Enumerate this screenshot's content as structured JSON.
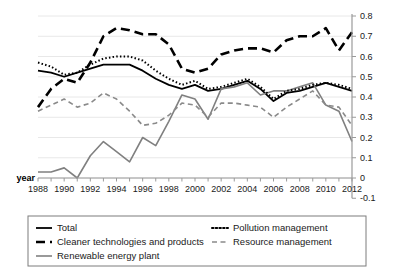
{
  "chart_data": {
    "type": "line",
    "title": "",
    "xlabel": "year",
    "ylabel": "",
    "grid": true,
    "legend_position": "bottom",
    "ylim": [
      -0.1,
      0.8
    ],
    "y_axis_side": "right",
    "yticks": [
      "0.8",
      "0.7",
      "0.6",
      "0.5",
      "0.4",
      "0.3",
      "0.2",
      "0.1",
      "0",
      "-0.1"
    ],
    "ytick_values": [
      0.8,
      0.7,
      0.6,
      0.5,
      0.4,
      0.3,
      0.2,
      0.1,
      0,
      -0.1
    ],
    "x": [
      1988,
      1989,
      1990,
      1991,
      1992,
      1993,
      1994,
      1995,
      1996,
      1997,
      1998,
      1999,
      2000,
      2001,
      2002,
      2003,
      2004,
      2005,
      2006,
      2007,
      2008,
      2009,
      2010,
      2011,
      2012
    ],
    "xticklabels": [
      "1988",
      "1990",
      "1992",
      "1994",
      "1996",
      "1998",
      "2000",
      "2002",
      "2004",
      "2006",
      "2008",
      "2010",
      "2012"
    ],
    "xtick_values": [
      1988,
      1990,
      1992,
      1994,
      1996,
      1998,
      2000,
      2002,
      2004,
      2006,
      2008,
      2010,
      2012
    ],
    "series": [
      {
        "name": "Total",
        "style": "solid",
        "color": "#000000",
        "width": 1.8,
        "values": [
          0.53,
          0.52,
          0.5,
          0.52,
          0.54,
          0.56,
          0.56,
          0.56,
          0.53,
          0.49,
          0.46,
          0.44,
          0.46,
          0.43,
          0.44,
          0.46,
          0.48,
          0.44,
          0.38,
          0.42,
          0.43,
          0.45,
          0.47,
          0.45,
          0.43
        ]
      },
      {
        "name": "Cleaner technologies and products",
        "style": "long-dash",
        "color": "#000000",
        "width": 2.6,
        "values": [
          0.35,
          0.44,
          0.49,
          0.47,
          0.57,
          0.7,
          0.74,
          0.73,
          0.71,
          0.71,
          0.66,
          0.54,
          0.52,
          0.54,
          0.61,
          0.63,
          0.64,
          0.64,
          0.62,
          0.68,
          0.7,
          0.7,
          0.74,
          0.63,
          0.72
        ]
      },
      {
        "name": "Renewable energy plant",
        "style": "solid",
        "color": "#808080",
        "width": 1.6,
        "values": [
          0.03,
          0.03,
          0.05,
          0.0,
          0.11,
          0.18,
          0.13,
          0.08,
          0.2,
          0.16,
          0.28,
          0.41,
          0.39,
          0.29,
          0.44,
          0.45,
          0.47,
          0.41,
          0.43,
          0.43,
          0.45,
          0.47,
          0.36,
          0.33,
          0.18
        ]
      },
      {
        "name": "Pollution management",
        "style": "dotted",
        "color": "#000000",
        "width": 2.0,
        "values": [
          0.57,
          0.55,
          0.51,
          0.52,
          0.56,
          0.59,
          0.6,
          0.6,
          0.58,
          0.53,
          0.49,
          0.46,
          0.48,
          0.44,
          0.45,
          0.47,
          0.49,
          0.45,
          0.39,
          0.43,
          0.44,
          0.46,
          0.47,
          0.46,
          0.44
        ]
      },
      {
        "name": "Resource management",
        "style": "dash",
        "color": "#8a8a8a",
        "width": 1.6,
        "values": [
          0.33,
          0.36,
          0.39,
          0.35,
          0.37,
          0.42,
          0.39,
          0.33,
          0.26,
          0.27,
          0.31,
          0.37,
          0.36,
          0.3,
          0.37,
          0.37,
          0.36,
          0.35,
          0.3,
          0.35,
          0.39,
          0.43,
          0.36,
          0.35,
          0.26
        ]
      }
    ]
  },
  "legend": {
    "entries": [
      {
        "label": "Total",
        "key": "total"
      },
      {
        "label": "Cleaner technologies and products",
        "key": "cleaner-technologies-and-products"
      },
      {
        "label": "Renewable energy plant",
        "key": "renewable-energy-plant"
      },
      {
        "label": "Pollution management",
        "key": "pollution-management"
      },
      {
        "label": "Resource management",
        "key": "resource-management"
      }
    ]
  },
  "axis": {
    "x_title": "year"
  }
}
